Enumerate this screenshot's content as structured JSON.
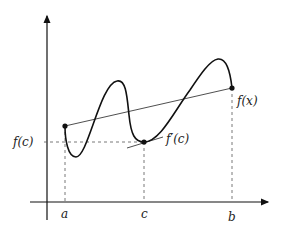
{
  "diagram": {
    "labels": {
      "a": "a",
      "b": "b",
      "c": "c",
      "fc": "f(c)",
      "fx": "f(x)",
      "fprime_c": "f′(c)"
    },
    "points": {
      "a": {
        "x": 65,
        "y": 126
      },
      "c": {
        "x": 144,
        "y": 142
      },
      "b": {
        "x": 232,
        "y": 88
      }
    },
    "colors": {
      "stroke": "#111111",
      "dashed": "#555555"
    }
  }
}
